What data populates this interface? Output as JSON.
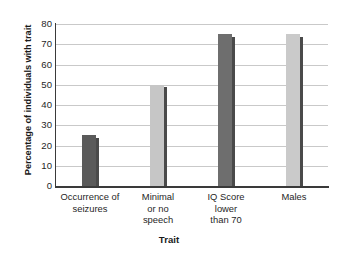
{
  "chart_data": {
    "type": "bar",
    "title": "",
    "xlabel": "Trait",
    "ylabel": "Percentage of individuals with trait",
    "categories": [
      "Occurrence of seizures",
      "Minimal or no speech",
      "IQ Score lower than 70",
      "Males"
    ],
    "category_lines": [
      [
        "Occurrence of",
        "seizures"
      ],
      [
        "Minimal",
        "or no",
        "speech"
      ],
      [
        "IQ Score",
        "lower",
        "than 70"
      ],
      [
        "Males"
      ]
    ],
    "values": [
      25,
      50,
      75,
      75
    ],
    "ylim": [
      0,
      80
    ],
    "yticks": [
      0,
      10,
      20,
      30,
      40,
      50,
      60,
      70,
      80
    ],
    "ytick_labels": [
      "0",
      "10",
      "20",
      "30",
      "40",
      "50",
      "60",
      "70",
      "80"
    ],
    "grid": true,
    "legend": "none",
    "bar_colors": [
      "#5a5a5a",
      "#c6c6c6",
      "#6e6e6e",
      "#cacaca"
    ],
    "bar_edge_color": "#4a4a4a",
    "gridline_color": "#c9c9c9",
    "axis_color": "#3a3a3a",
    "background_color": "#ffffff"
  }
}
